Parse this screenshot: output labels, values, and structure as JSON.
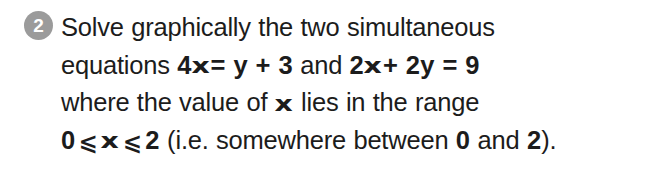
{
  "page": {
    "background_color": "#ffffff",
    "text_color": "#1c1c1c"
  },
  "question": {
    "number": "2",
    "badge_color": "#9b9b9b",
    "badge_text_color": "#ffffff",
    "variable_symbol": "x",
    "less_equal_symbol": "⩽",
    "lines": [
      {
        "id": "line-1",
        "segments": [
          {
            "text": "Solve graphically the two simultaneous",
            "bold": false
          }
        ]
      },
      {
        "id": "line-2",
        "segments": [
          {
            "text": "equations ",
            "bold": false
          },
          {
            "text": "4x = y + 3",
            "bold": true
          },
          {
            "text": " and ",
            "bold": false
          },
          {
            "text": "2x + 2y = 9",
            "bold": true
          }
        ]
      },
      {
        "id": "line-3",
        "segments": [
          {
            "text": "where the value of ",
            "bold": false
          },
          {
            "text": "x",
            "bold": true
          },
          {
            "text": " lies in the range",
            "bold": false
          }
        ]
      },
      {
        "id": "line-4",
        "segments": [
          {
            "text": "0 ⩽ x ⩽ 2",
            "bold": true
          },
          {
            "text": " (i.e. somewhere between ",
            "bold": false
          },
          {
            "text": "0",
            "bold": true
          },
          {
            "text": " and ",
            "bold": false
          },
          {
            "text": "2",
            "bold": true
          },
          {
            "text": ").",
            "bold": false
          }
        ]
      }
    ],
    "parts": {
      "line1_full": "Solve graphically the two simultaneous",
      "line2_prefix": "equations ",
      "equation_1": "4x = y + 3",
      "line2_joiner": " and ",
      "equation_2": "2x + 2y = 9",
      "line3_prefix": "where the value of ",
      "line3_suffix": " lies in the range",
      "range_zero": "0",
      "range_two": "2",
      "line4_note_open": " (i.e. somewhere between ",
      "line4_note_and": " and ",
      "line4_note_close": ")."
    }
  }
}
